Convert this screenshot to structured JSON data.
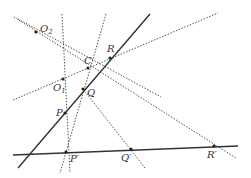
{
  "diagram": {
    "colors": {
      "solid": "#333333",
      "dotted": "#555555",
      "point": "#222222",
      "label": "#333333",
      "background": "#ffffff"
    },
    "solid_lines": [
      {
        "name": "line-PQR",
        "x1": 18,
        "y1": 168,
        "x2": 150,
        "y2": 14
      },
      {
        "name": "line-PQR-prime",
        "x1": 13,
        "y1": 155,
        "x2": 238,
        "y2": 146
      }
    ],
    "dotted_lines": [
      {
        "name": "line-O2-C",
        "x1": 18,
        "y1": 19,
        "x2": 161,
        "y2": 97
      },
      {
        "name": "line-O2-Rprime",
        "x1": 14,
        "y1": 17,
        "x2": 236,
        "y2": 158
      },
      {
        "name": "line-vertical-P",
        "x1": 62,
        "y1": 14,
        "x2": 70,
        "y2": 173
      },
      {
        "name": "line-Q-Pprime",
        "x1": 106,
        "y1": 14,
        "x2": 60,
        "y2": 173
      },
      {
        "name": "line-O1-R-ext",
        "x1": 13,
        "y1": 100,
        "x2": 218,
        "y2": 13
      },
      {
        "name": "line-Q-Qprime",
        "x1": 83,
        "y1": 89,
        "x2": 145,
        "y2": 168
      }
    ],
    "points": [
      {
        "id": "O2",
        "label": "O",
        "sub": "2",
        "x": 36,
        "y": 32,
        "lx": 40,
        "ly": 32
      },
      {
        "id": "C",
        "label": "C",
        "sub": "",
        "x": 88,
        "y": 68,
        "lx": 84,
        "ly": 64
      },
      {
        "id": "R",
        "label": "R",
        "sub": "",
        "x": 110,
        "y": 58,
        "lx": 107,
        "ly": 52
      },
      {
        "id": "O1",
        "label": "O",
        "sub": "1",
        "x": 63,
        "y": 79,
        "lx": 53,
        "ly": 91
      },
      {
        "id": "Q",
        "label": "Q",
        "sub": "",
        "x": 83,
        "y": 89,
        "lx": 87,
        "ly": 96
      },
      {
        "id": "P",
        "label": "P",
        "sub": "",
        "x": 65,
        "y": 113,
        "lx": 56,
        "ly": 116
      },
      {
        "id": "P-prime",
        "label": "P′",
        "sub": "",
        "x": 66,
        "y": 152,
        "lx": 70,
        "ly": 162
      },
      {
        "id": "Q-prime",
        "label": "Q′",
        "sub": "",
        "x": 131,
        "y": 149,
        "lx": 121,
        "ly": 161
      },
      {
        "id": "R-prime",
        "label": "R′",
        "sub": "",
        "x": 214,
        "y": 146,
        "lx": 207,
        "ly": 158
      }
    ]
  }
}
